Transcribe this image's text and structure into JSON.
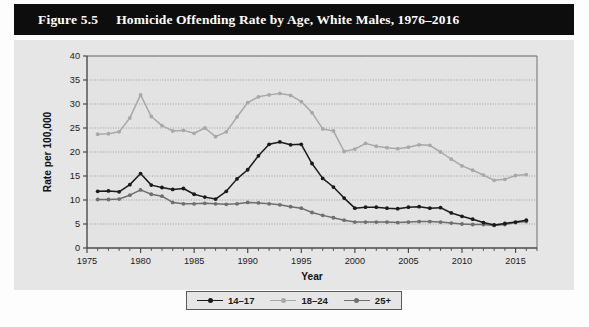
{
  "figure": {
    "number": "Figure 5.5",
    "title": "Homicide Offending Rate by Age, White Males, 1976–2016"
  },
  "colors": {
    "title_bar_bg": "#0d0d0d",
    "title_bar_text": "#ffffff",
    "panel_bg": "#e6e6e6",
    "plot_bg": "#e3e3e3",
    "axis": "#4a4a4a",
    "grid": "#8c8c8c",
    "series_14_17": "#1a1a1a",
    "series_18_24": "#a8a8a8",
    "series_25plus": "#6e6e6e"
  },
  "chart_data": {
    "type": "line",
    "title": "Homicide Offending Rate by Age, White Males, 1976–2016",
    "xlabel": "Year",
    "ylabel": "Rate per 100,000",
    "xlim": [
      1975,
      2017
    ],
    "ylim": [
      0,
      40
    ],
    "ytick_step": 5,
    "yticks": [
      0,
      5,
      10,
      15,
      20,
      25,
      30,
      35,
      40
    ],
    "xticks_major": [
      1975,
      1980,
      1985,
      1990,
      1995,
      2000,
      2005,
      2010,
      2015
    ],
    "xtick_minor_step": 1,
    "grid": "horizontal-dotted",
    "legend_position": "bottom-center",
    "x": [
      1976,
      1977,
      1978,
      1979,
      1980,
      1981,
      1982,
      1983,
      1984,
      1985,
      1986,
      1987,
      1988,
      1989,
      1990,
      1991,
      1992,
      1993,
      1994,
      1995,
      1996,
      1997,
      1998,
      1999,
      2000,
      2001,
      2002,
      2003,
      2004,
      2005,
      2006,
      2007,
      2008,
      2009,
      2010,
      2011,
      2012,
      2013,
      2014,
      2015,
      2016
    ],
    "series": [
      {
        "name": "14–17",
        "color": "#1a1a1a",
        "values": [
          11.8,
          11.9,
          11.7,
          13.2,
          15.5,
          13.1,
          12.6,
          12.2,
          12.4,
          11.2,
          10.6,
          10.2,
          11.8,
          14.4,
          16.3,
          19.2,
          21.6,
          22.1,
          21.5,
          21.6,
          17.6,
          14.5,
          12.7,
          10.4,
          8.3,
          8.5,
          8.5,
          8.3,
          8.2,
          8.5,
          8.6,
          8.3,
          8.4,
          7.3,
          6.6,
          6.0,
          5.3,
          4.8,
          5.1,
          5.4,
          5.8
        ]
      },
      {
        "name": "18–24",
        "color": "#a8a8a8",
        "values": [
          23.7,
          23.8,
          24.2,
          27.1,
          31.9,
          27.4,
          25.5,
          24.4,
          24.5,
          23.9,
          25.0,
          23.2,
          24.2,
          27.3,
          30.3,
          31.5,
          31.9,
          32.2,
          31.8,
          30.5,
          28.2,
          24.8,
          24.4,
          20.1,
          20.6,
          21.8,
          21.2,
          20.9,
          20.7,
          21.0,
          21.5,
          21.4,
          20.0,
          18.5,
          17.1,
          16.2,
          15.2,
          14.1,
          14.3,
          15.1,
          15.3
        ]
      },
      {
        "name": "25+",
        "color": "#6e6e6e",
        "values": [
          10.1,
          10.1,
          10.2,
          11.0,
          12.1,
          11.2,
          10.8,
          9.5,
          9.2,
          9.2,
          9.3,
          9.2,
          9.1,
          9.2,
          9.5,
          9.4,
          9.2,
          9.0,
          8.6,
          8.3,
          7.4,
          6.8,
          6.3,
          5.8,
          5.4,
          5.4,
          5.4,
          5.4,
          5.3,
          5.4,
          5.5,
          5.5,
          5.4,
          5.2,
          5.0,
          4.9,
          4.9,
          4.7,
          4.9,
          5.3,
          5.5
        ]
      }
    ]
  },
  "legend": {
    "items": [
      {
        "label": "14–17",
        "color": "#1a1a1a"
      },
      {
        "label": "18–24",
        "color": "#a8a8a8"
      },
      {
        "label": "25+",
        "color": "#6e6e6e"
      }
    ]
  }
}
